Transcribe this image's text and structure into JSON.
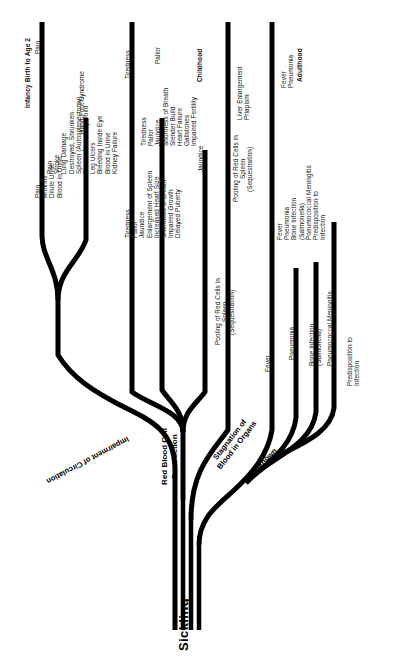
{
  "figure": {
    "root_label": "Sickling",
    "pathways": [
      {
        "id": "impairment",
        "label": "Impairment of Circulation"
      },
      {
        "id": "rbc",
        "label": "Red Blood Cell\nDestruction",
        "line1": "Red Blood Cell",
        "line2": "Destruction"
      },
      {
        "id": "stagnation",
        "label": "Stagnation of\nBlood in Organs",
        "line1": "Stagnation of",
        "line2": "Blood in Organs"
      },
      {
        "id": "unknown",
        "label": "Unknown"
      }
    ],
    "columns": [
      {
        "id": "infancy",
        "header": "Infancy  Birth to Age 2"
      },
      {
        "id": "childhood",
        "header": "Childhood"
      },
      {
        "id": "adulthood",
        "header": "Adulthood"
      }
    ],
    "groups": [
      {
        "id": "impairment-circulation",
        "pathway": "Impairment of Circulation",
        "infancy": [
          "Pain",
          "Hand-Foot Syndrome"
        ],
        "childhood": [
          "Pain",
          "Arthritis",
          "Dilute Urine",
          "Blood in Urine"
        ],
        "adulthood": [
          "Pain",
          "Stroke",
          "Lung Damage",
          "Destroyed, Shrunken",
          "Spleen (Autosplenectomy)",
          "Destruction of Hip Joint",
          "Leg Ulcers",
          "Bleeding Inside Eye",
          "Blood in Urine",
          "Kidney Failure"
        ]
      },
      {
        "id": "red-blood-cell-destruction",
        "pathway": "Red Blood Cell Destruction",
        "infancy": [
          "Tiredness",
          "Pallor",
          "Jaundice"
        ],
        "childhood": [
          "Tiredness",
          "Pallor",
          "Jaundice",
          "Enlargement of Spleen",
          "Increased Heart Size",
          "Shortness of Breath",
          "Impaired Growth",
          "Delayed Puberty"
        ],
        "adulthood": [
          "Tiredness",
          "Pallor",
          "Jaundice",
          "Shortness of Breath",
          "Slender Build",
          "Heart Failure",
          "Gallstones",
          "Impaired Fertility"
        ]
      },
      {
        "id": "stagnation-blood-organs",
        "pathway": "Stagnation of Blood in Organs",
        "infancy": [
          "Pooling of Red Cells in",
          "Spleen",
          "(Sequestration)"
        ],
        "childhood": [
          "Pooling of Red Cells in",
          "Spleen",
          "(Sequestration)"
        ],
        "adulthood": [
          "Liver Enlargement",
          "Priapism"
        ]
      },
      {
        "id": "unknown-infection",
        "pathway": "Unknown",
        "infancy": [
          "Fever",
          "Pneumonia",
          "Bone Infection",
          "(Salmonella)",
          "Pneumococcal Meningitis",
          "Predisposition to",
          "Infection"
        ],
        "childhood": [
          "Fever",
          "Pneumonia",
          "Bone Infection",
          "(Salmonella)",
          "Pneumococcal Meningitis",
          "Predisposition to",
          "Infection"
        ],
        "adulthood": [
          "Fever",
          "Pneumonia"
        ]
      }
    ],
    "text_blocks": {
      "adult_impairment": "Pain\nStroke\nLung Damage\nDestroyed, Shrunken\n  Spleen (Autosplenectomy)\nDestruction of Hip Joint\nLeg Ulcers\nBleeding Inside Eye\nBlood in Urine\nKidney Failure",
      "adult_rbc": "Tiredness\nPallor\nJaundice\nShortness of Breath\nSlender Build\nHeart Failure\nGallstones\nImpaired Fertility",
      "adult_stagnation": "Liver Enlargement\nPriapism",
      "adult_unknown": "Fever\nPneumonia",
      "child_impairment": "Pain\nArthritis\nDilute Urine\nBlood in Urine",
      "child_rbc": "Tiredness\nPallor\nJaundice\nEnlargement of Spleen\nIncreased Heart Size\nShortness of Breath\nImpaired Growth\nDelayed Puberty",
      "child_stagnation": "Pooling of Red Cells in\nSpleen\n(Sequestration)",
      "child_unknown": "Fever\nPneumonia\nBone Infection\n  (Salmonella)\nPneumococcal Meningitis\nPredisposition to\n  Infection",
      "inf_pain": "Pain",
      "inf_handfoot": "Hand-Foot Syndrome",
      "inf_tiredness": "Tiredness",
      "inf_pallor": "Pallor",
      "inf_jaundice": "Jaundice",
      "inf_stagnation": "Pooling of Red Cells in\nSpleen\n(Sequestration)",
      "inf_fever": "Fever",
      "inf_pneumonia": "Pneumonia",
      "inf_bone": "Bone Infection\n(Salmonella)",
      "inf_mening": "Pneumococcal Meningitis",
      "inf_predisp": "Predisposition to\nInfection"
    },
    "colors": {
      "ink": "#000000",
      "background": "#ffffff"
    }
  }
}
